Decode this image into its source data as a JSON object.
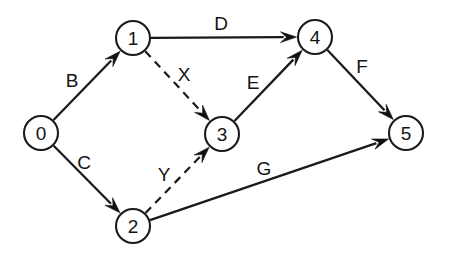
{
  "figure": {
    "background_color": "#ffffff",
    "stroke_color": "#1a1a1a",
    "width": 451,
    "height": 258
  },
  "nodes": [
    {
      "id": "0",
      "label": "0",
      "cx": 41,
      "cy": 133,
      "r": 17
    },
    {
      "id": "1",
      "label": "1",
      "cx": 133,
      "cy": 38,
      "r": 17
    },
    {
      "id": "2",
      "label": "2",
      "cx": 133,
      "cy": 226,
      "r": 17
    },
    {
      "id": "3",
      "label": "3",
      "cx": 222,
      "cy": 134,
      "r": 17
    },
    {
      "id": "4",
      "label": "4",
      "cx": 315,
      "cy": 37,
      "r": 17
    },
    {
      "id": "5",
      "label": "5",
      "cx": 406,
      "cy": 133,
      "r": 17
    }
  ],
  "edges": [
    {
      "id": "B",
      "label": "B",
      "from": "0",
      "to": "1",
      "style": "solid",
      "label_x": 72,
      "label_y": 80
    },
    {
      "id": "C",
      "label": "C",
      "from": "0",
      "to": "2",
      "style": "solid",
      "label_x": 84,
      "label_y": 162
    },
    {
      "id": "D",
      "label": "D",
      "from": "1",
      "to": "4",
      "style": "solid",
      "label_x": 221,
      "label_y": 23
    },
    {
      "id": "X",
      "label": "X",
      "from": "1",
      "to": "3",
      "style": "dashed",
      "label_x": 184,
      "label_y": 74
    },
    {
      "id": "Y",
      "label": "Y",
      "from": "2",
      "to": "3",
      "style": "dashed",
      "label_x": 164,
      "label_y": 174
    },
    {
      "id": "E",
      "label": "E",
      "from": "3",
      "to": "4",
      "style": "solid",
      "label_x": 253,
      "label_y": 82
    },
    {
      "id": "F",
      "label": "F",
      "from": "4",
      "to": "5",
      "style": "solid",
      "label_x": 362,
      "label_y": 66
    },
    {
      "id": "G",
      "label": "G",
      "from": "2",
      "to": "5",
      "style": "solid",
      "label_x": 264,
      "label_y": 168
    }
  ]
}
